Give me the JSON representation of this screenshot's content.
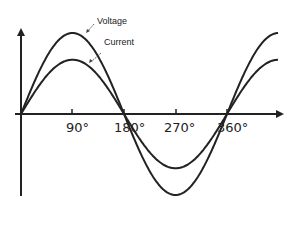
{
  "chart_data": {
    "type": "line",
    "title": "",
    "xlabel": "",
    "ylabel": "",
    "x_ticks": [
      "90°",
      "180°",
      "270°",
      "360°"
    ],
    "x_tick_degrees": [
      90,
      180,
      270,
      360
    ],
    "xlim_degrees": [
      0,
      450
    ],
    "grid": false,
    "legend_position": "annotations-top",
    "series": [
      {
        "name": "Voltage",
        "function": "sine",
        "amplitude_relative": 1.0,
        "phase_degrees": 0,
        "color": "#222222"
      },
      {
        "name": "Current",
        "function": "sine",
        "amplitude_relative": 0.67,
        "phase_degrees": 0,
        "color": "#222222"
      }
    ],
    "annotations": [
      {
        "text": "Voltage",
        "points_to": "Voltage peak"
      },
      {
        "text": "Current",
        "points_to": "Current peak"
      }
    ]
  },
  "labels": {
    "voltage": "Voltage",
    "current": "Current",
    "tick_90": "90°",
    "tick_180": "180°",
    "tick_270": "270°",
    "tick_360": "360°"
  },
  "colors": {
    "line": "#222222",
    "background": "#ffffff"
  }
}
